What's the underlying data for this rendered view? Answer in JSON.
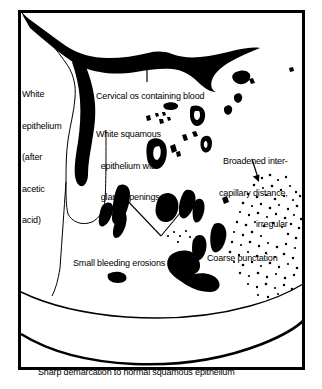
{
  "figure": {
    "type": "medical-illustration",
    "background_color": "#ffffff",
    "ink_color": "#000000",
    "frame": {
      "x": 18,
      "y": 10,
      "width": 287,
      "height": 360,
      "border_width": 3
    }
  },
  "labels": {
    "white_epithelium": {
      "lines": [
        "White",
        "epithelium",
        "(after",
        "acetic",
        "acid)"
      ],
      "text": "White epithelium (after acetic acid)"
    },
    "cervical_os": {
      "lines": [
        "Cervical os containing blood"
      ],
      "text": "Cervical os containing blood"
    },
    "white_squamous": {
      "lines": [
        "White squamous",
        "  epithelium with",
        "  gland openings"
      ],
      "text": "White squamous epithelium with gland openings"
    },
    "broadened_intercapillary": {
      "lines": [
        "Broadened inter-",
        "capillary distance,",
        "irregular"
      ],
      "text": "Broadened inter-capillary distance, irregular"
    },
    "bleeding_erosions": {
      "lines": [
        "Small bleeding erosions"
      ],
      "text": "Small bleeding erosions"
    },
    "coarse_punctation": {
      "lines": [
        "Coarse punctation"
      ],
      "text": "Coarse punctation"
    },
    "sharp_demarcation": {
      "lines": [
        "Sharp demarcation to normal squamous epithelium"
      ],
      "text": "Sharp demarcation to normal squamous epithelium"
    }
  },
  "annotations": {
    "arrows": [
      {
        "name": "cervical-os-arrow",
        "direction": "up",
        "from": [
          147,
          82
        ],
        "to": [
          147,
          61
        ]
      },
      {
        "name": "broadened-arrow",
        "direction": "down",
        "from": [
          253,
          160
        ],
        "to": [
          258,
          180
        ]
      },
      {
        "name": "erosion-arrow-left",
        "direction": "up-left",
        "from": [
          161,
          236
        ],
        "to": [
          119,
          192
        ]
      },
      {
        "name": "erosion-arrow-right",
        "direction": "up-right",
        "from": [
          161,
          236
        ],
        "to": [
          188,
          204
        ]
      }
    ]
  }
}
